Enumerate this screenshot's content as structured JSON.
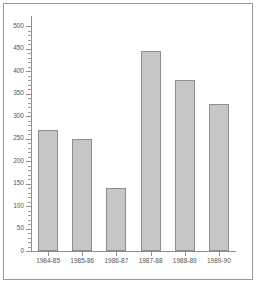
{
  "chart_data": {
    "type": "bar",
    "title": "",
    "subtitle": "",
    "xlabel": "",
    "ylabel": "",
    "categories": [
      "1984-85",
      "1985-86",
      "1986-87",
      "1987-88",
      "1988-89",
      "1989-90"
    ],
    "values": [
      270,
      250,
      140,
      445,
      380,
      327
    ],
    "ylim": [
      0,
      500
    ],
    "y_ticks_major": [
      0,
      50,
      100,
      150,
      200,
      250,
      300,
      350,
      400,
      450,
      500
    ],
    "y_tick_labels": [
      "0",
      "50",
      "100",
      "150",
      "200",
      "250",
      "300",
      "350",
      "400",
      "450",
      "500"
    ],
    "y_ticks_minor_step": 10,
    "grid": false,
    "legend": null,
    "legend_position": "none",
    "bar_fill_color": "#c6c6c6",
    "bar_edge_color": "#8f8f8f",
    "axis_color": "#8e8e8e",
    "text_color": "#555555",
    "frame_color": "#9a9a9a",
    "background_color": "#ffffff"
  }
}
